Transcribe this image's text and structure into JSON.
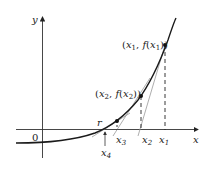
{
  "diagram": {
    "axes": {
      "x_label": "x",
      "y_label": "y",
      "origin_label": "0"
    },
    "points": [
      {
        "id": "p1",
        "label_var": "x",
        "label_sub": "1",
        "coord_label": "(x1, f(x1))"
      },
      {
        "id": "p2",
        "label_var": "x",
        "label_sub": "2",
        "coord_label": "(x2, f(x2))"
      },
      {
        "id": "p3",
        "label_var": "x",
        "label_sub": "3"
      }
    ],
    "x_ticks": [
      {
        "var": "x",
        "sub": "1"
      },
      {
        "var": "x",
        "sub": "2"
      },
      {
        "var": "x",
        "sub": "3"
      },
      {
        "var": "x",
        "sub": "4"
      }
    ],
    "root_label": "r",
    "labels": {
      "p1_open": "(",
      "p1_x": "x",
      "p1_xsub": "1",
      "p1_comma": ", ",
      "p1_f": "f",
      "p1_paren": "(",
      "p1_x2": "x",
      "p1_x2sub": "1",
      "p1_close": "))",
      "p2_open": "(",
      "p2_x": "x",
      "p2_xsub": "2",
      "p2_comma": ", ",
      "p2_f": "f",
      "p2_paren": "(",
      "p2_x2": "x",
      "p2_x2sub": "2",
      "p2_close": "))"
    },
    "colors": {
      "curve": "#1a1a1a",
      "axis": "#333333",
      "tangent": "#888888",
      "dashed": "#222222",
      "background": "#ffffff"
    }
  }
}
